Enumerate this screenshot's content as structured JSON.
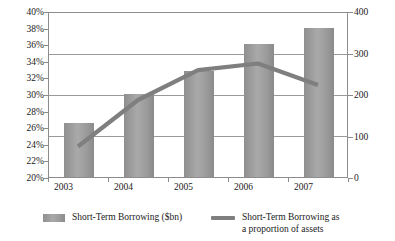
{
  "chart_data": {
    "type": "bar",
    "title": "",
    "subtitle": "",
    "xlabel": "",
    "ylabel": "",
    "grid": true,
    "legend_position": "bottom",
    "categories": [
      "2003",
      "2004",
      "2005",
      "2006",
      "2007"
    ],
    "series": [
      {
        "name": "Short-Term Borrowing ($bn)",
        "type": "bar",
        "axis": "right",
        "color": "#9b9b9b",
        "values": [
          130,
          200,
          255,
          320,
          360
        ]
      },
      {
        "name": "Short-Term Borrowing as a proportion of assets",
        "type": "line",
        "axis": "left",
        "color": "#7f7f7f",
        "values": [
          23.8,
          29.4,
          33.0,
          33.8,
          31.2
        ]
      }
    ],
    "axes": {
      "left": {
        "label": "",
        "ylim": [
          20,
          40
        ],
        "tick_step": 2,
        "tick_labels": [
          "20%",
          "22%",
          "24%",
          "26%",
          "28%",
          "30%",
          "32%",
          "34%",
          "36%",
          "38%",
          "40%"
        ],
        "gridline_values": [
          25,
          30,
          35
        ]
      },
      "right": {
        "label": "",
        "ylim": [
          0,
          400
        ],
        "tick_step": 100,
        "tick_labels": [
          "0",
          "100",
          "200",
          "300",
          "400"
        ]
      },
      "bottom": {
        "tick_labels": [
          "2003",
          "2004",
          "2005",
          "2006",
          "2007"
        ]
      }
    }
  },
  "legend": {
    "entries": [
      {
        "label": "Short-Term Borrowing ($bn)",
        "marker": "bar-swatch"
      },
      {
        "label_line1": "Short-Term Borrowing as",
        "label_line2": "a proportion of assets",
        "marker": "line-swatch"
      }
    ]
  },
  "colors": {
    "bar_fill": "#9b9b9b",
    "line_stroke": "#7f7f7f",
    "gridline": "#9a9a9a",
    "axis_border": "#8c8c8c",
    "background": "#ffffff",
    "text": "#1a1a1a"
  }
}
